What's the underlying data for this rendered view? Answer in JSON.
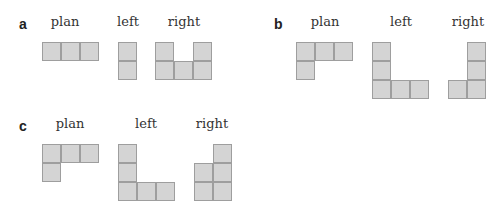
{
  "cell_size": 19,
  "colors": {
    "fill": "#d4d4d4",
    "stroke": "#9e9e9e"
  },
  "panels": [
    {
      "id": "a",
      "label": "a",
      "label_pos": [
        19,
        17
      ],
      "views": [
        {
          "name": "plan",
          "caption": "plan",
          "caption_x": 65,
          "caption_y": 15,
          "origin": [
            42,
            42
          ],
          "cells": [
            [
              0,
              0
            ],
            [
              1,
              0
            ],
            [
              2,
              0
            ]
          ]
        },
        {
          "name": "left",
          "caption": "left",
          "caption_x": 128,
          "caption_y": 15,
          "origin": [
            118,
            42
          ],
          "cells": [
            [
              0,
              0
            ],
            [
              0,
              1
            ]
          ]
        },
        {
          "name": "right",
          "caption": "right",
          "caption_x": 184,
          "caption_y": 15,
          "origin": [
            155,
            42
          ],
          "cells": [
            [
              0,
              0
            ],
            [
              2,
              0
            ],
            [
              0,
              1
            ],
            [
              1,
              1
            ],
            [
              2,
              1
            ]
          ]
        }
      ]
    },
    {
      "id": "b",
      "label": "b",
      "label_pos": [
        274,
        17
      ],
      "views": [
        {
          "name": "plan",
          "caption": "plan",
          "caption_x": 325,
          "caption_y": 15,
          "origin": [
            296,
            42
          ],
          "cells": [
            [
              0,
              0
            ],
            [
              1,
              0
            ],
            [
              2,
              0
            ],
            [
              0,
              1
            ]
          ]
        },
        {
          "name": "left",
          "caption": "left",
          "caption_x": 401,
          "caption_y": 15,
          "origin": [
            372,
            42
          ],
          "cells": [
            [
              0,
              0
            ],
            [
              0,
              1
            ],
            [
              0,
              2
            ],
            [
              1,
              2
            ],
            [
              2,
              2
            ]
          ]
        },
        {
          "name": "right",
          "caption": "right",
          "caption_x": 468,
          "caption_y": 15,
          "origin": [
            448,
            42
          ],
          "cells": [
            [
              1,
              0
            ],
            [
              1,
              1
            ],
            [
              0,
              2
            ],
            [
              1,
              2
            ]
          ]
        }
      ]
    },
    {
      "id": "c",
      "label": "c",
      "label_pos": [
        19,
        119
      ],
      "views": [
        {
          "name": "plan",
          "caption": "plan",
          "caption_x": 70,
          "caption_y": 117,
          "origin": [
            42,
            144
          ],
          "cells": [
            [
              0,
              0
            ],
            [
              1,
              0
            ],
            [
              2,
              0
            ],
            [
              0,
              1
            ]
          ]
        },
        {
          "name": "left",
          "caption": "left",
          "caption_x": 146,
          "caption_y": 117,
          "origin": [
            118,
            144
          ],
          "cells": [
            [
              0,
              0
            ],
            [
              0,
              1
            ],
            [
              0,
              2
            ],
            [
              1,
              2
            ],
            [
              2,
              2
            ]
          ]
        },
        {
          "name": "right",
          "caption": "right",
          "caption_x": 212,
          "caption_y": 117,
          "origin": [
            194,
            144
          ],
          "cells": [
            [
              1,
              0
            ],
            [
              0,
              1
            ],
            [
              1,
              1
            ],
            [
              0,
              2
            ],
            [
              1,
              2
            ]
          ]
        }
      ]
    }
  ]
}
